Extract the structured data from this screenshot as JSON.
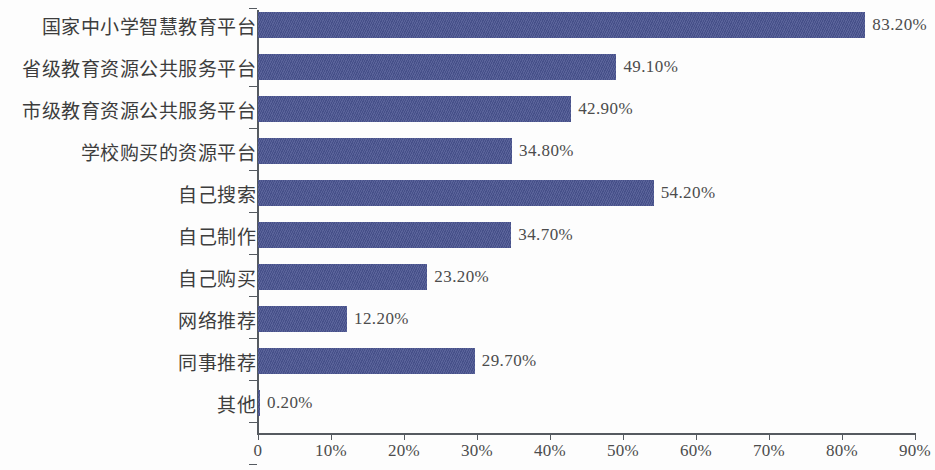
{
  "chart_data": {
    "type": "bar",
    "orientation": "horizontal",
    "title": "",
    "subtitle": "",
    "xlabel": "",
    "ylabel": "",
    "xlim": [
      0,
      90
    ],
    "grid": false,
    "legend": false,
    "bar_color": "#4a5490",
    "axis_color": "#555a60",
    "background_color": "#fdfdfd",
    "xticks": [
      "0",
      "10%",
      "20%",
      "30%",
      "40%",
      "50%",
      "60%",
      "70%",
      "80%",
      "90%"
    ],
    "xtick_values": [
      0,
      10,
      20,
      30,
      40,
      50,
      60,
      70,
      80,
      90
    ],
    "categories": [
      "国家中小学智慧教育平台",
      "省级教育资源公共服务平台",
      "市级教育资源公共服务平台",
      "学校购买的资源平台",
      "自己搜索",
      "自己制作",
      "自己购买",
      "网络推荐",
      "同事推荐",
      "其他"
    ],
    "values": [
      83.2,
      49.1,
      42.9,
      34.8,
      54.2,
      34.7,
      23.2,
      12.2,
      29.7,
      0.2
    ],
    "data_labels": [
      "83.20%",
      "49.10%",
      "42.90%",
      "34.80%",
      "54.20%",
      "34.70%",
      "23.20%",
      "12.20%",
      "29.70%",
      "0.20%"
    ]
  }
}
